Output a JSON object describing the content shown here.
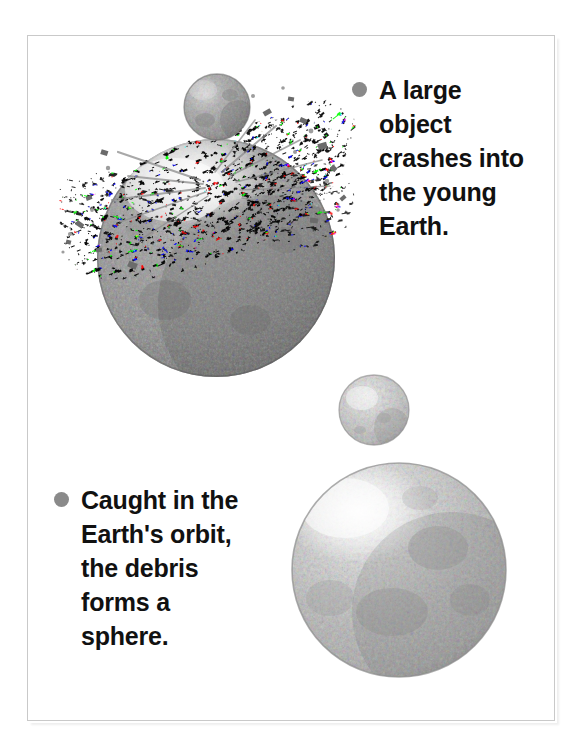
{
  "page": {
    "background_color": "#ffffff",
    "frame": {
      "border_color": "#c9c9c9",
      "fill_color": "#ffffff"
    }
  },
  "diagram": {
    "title_implied": "Giant impact origin of the Moon",
    "bullet_color": "#8a8a8a",
    "text_color": "#111111",
    "captions": [
      {
        "id": "caption-1",
        "bullet_icon": "filled-circle-bullet",
        "text": "A large\nobject\ncrashes into\nthe young\nEarth.",
        "lines": [
          "A large",
          "object",
          "crashes into",
          "the young",
          "Earth."
        ]
      },
      {
        "id": "caption-2",
        "bullet_icon": "filled-circle-bullet",
        "text": "Caught in the\nEarth's orbit,\nthe debris\nforms a\nsphere.",
        "lines": [
          "Caught in the",
          "Earth’s orbit,",
          "the debris",
          "forms a",
          "sphere."
        ]
      }
    ],
    "objects": [
      {
        "name": "impactor-sphere",
        "label": "large impacting object",
        "cx": 217,
        "cy": 107,
        "r": 33,
        "tone": "medium-gray",
        "base_color": "#9a9a9a",
        "highlight_color": "#d8d8d8",
        "shadow_color": "#6f6f6f"
      },
      {
        "name": "young-earth-sphere",
        "label": "young Earth",
        "cx": 216,
        "cy": 258,
        "r": 119,
        "tone": "dark-gray",
        "base_color": "#8c8c8c",
        "highlight_color": "#c4c4c4",
        "shadow_color": "#5e5e5e"
      },
      {
        "name": "debris-cloud",
        "label": "ejected debris spray",
        "x": 60,
        "y": 120,
        "width": 290,
        "height": 150,
        "tone": "speckled-gray",
        "base_color": "#8f8f8f"
      },
      {
        "name": "moon-small-sphere",
        "label": "coalescing debris sphere",
        "cx": 374,
        "cy": 410,
        "r": 35,
        "tone": "light-gray",
        "base_color": "#c8c8c8",
        "highlight_color": "#f0f0f0",
        "shadow_color": "#909090"
      },
      {
        "name": "moon-large-sphere",
        "label": "formed Moon",
        "cx": 399,
        "cy": 570,
        "r": 107,
        "tone": "light-medium-gray",
        "base_color": "#b0b0b0",
        "highlight_color": "#f2f2f2",
        "shadow_color": "#7c7c7c"
      }
    ]
  }
}
